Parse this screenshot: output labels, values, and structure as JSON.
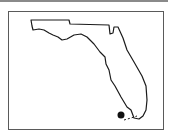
{
  "map": {
    "region": "Florida",
    "outline_color": "#1a1a1a",
    "frame_color": "#5a5a5a",
    "marker": {
      "label": "location-marker",
      "color": "#111111"
    }
  }
}
